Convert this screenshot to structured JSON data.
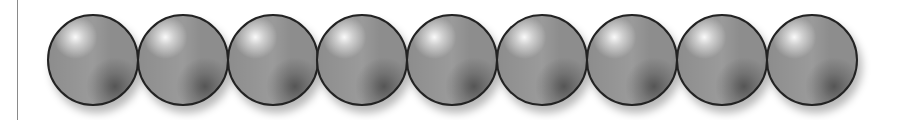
{
  "figure": {
    "sphere_count": 9,
    "sphere_color": "#8d8d8d",
    "outline_color": "#232323",
    "spheres": [
      {
        "id": 1,
        "left": 47
      },
      {
        "id": 2,
        "left": 137
      },
      {
        "id": 3,
        "left": 227
      },
      {
        "id": 4,
        "left": 316
      },
      {
        "id": 5,
        "left": 406
      },
      {
        "id": 6,
        "left": 496
      },
      {
        "id": 7,
        "left": 586
      },
      {
        "id": 8,
        "left": 676
      },
      {
        "id": 9,
        "left": 766
      }
    ]
  }
}
